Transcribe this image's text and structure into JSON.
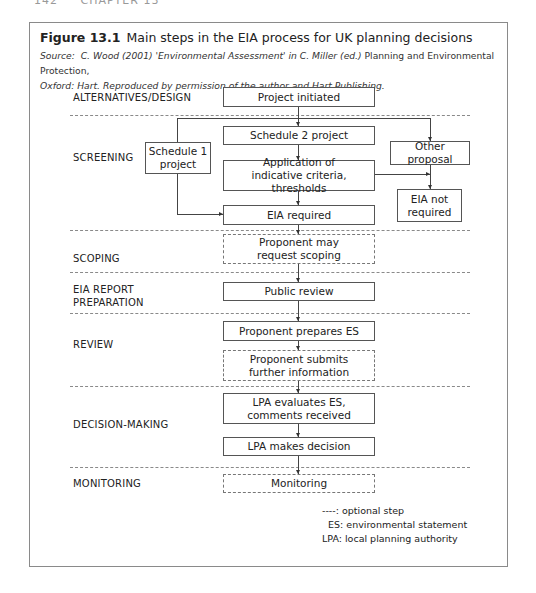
{
  "running_head": {
    "page": "142",
    "chapter": "CHAPTER 13"
  },
  "figure": {
    "label": "Figure 13.1",
    "title": "Main steps in the EIA process for UK planning decisions",
    "source_prefix": "Source:",
    "source_italic_1": "C. Wood (2001) 'Environmental Assessment' in C. Miller (ed.)",
    "source_plain_1": "Planning and Environmental Protection,",
    "source_italic_2": "Oxford: Hart. Reproduced by permission of the author and Hart Publishing."
  },
  "stages": [
    {
      "id": "alternatives",
      "label": "ALTERNATIVES/DESIGN"
    },
    {
      "id": "screening",
      "label": "SCREENING"
    },
    {
      "id": "scoping",
      "label": "SCOPING"
    },
    {
      "id": "eia_report_1",
      "label": "EIA REPORT"
    },
    {
      "id": "eia_report_2",
      "label": "PREPARATION"
    },
    {
      "id": "review",
      "label": "REVIEW"
    },
    {
      "id": "decision",
      "label": "DECISION-MAKING"
    },
    {
      "id": "monitoring",
      "label": "MONITORING"
    }
  ],
  "nodes": {
    "project_initiated": {
      "label": "Project initiated",
      "optional": false
    },
    "schedule2": {
      "label": "Schedule 2 project",
      "optional": false
    },
    "schedule1_l1": {
      "label": "Schedule 1"
    },
    "schedule1_l2": {
      "label": "project"
    },
    "application_l1": {
      "label": "Application of"
    },
    "application_l2": {
      "label": "indicative criteria, thresholds"
    },
    "other_proposal": {
      "label": "Other proposal",
      "optional": false
    },
    "eia_not_required_l1": {
      "label": "EIA not"
    },
    "eia_not_required_l2": {
      "label": "required"
    },
    "eia_required": {
      "label": "EIA required",
      "optional": false
    },
    "scoping_l1": {
      "label": "Proponent may"
    },
    "scoping_l2": {
      "label": "request scoping",
      "optional": true
    },
    "public_review": {
      "label": "Public review",
      "optional": false
    },
    "prepares_es": {
      "label": "Proponent prepares ES",
      "optional": false
    },
    "submits_l1": {
      "label": "Proponent submits"
    },
    "submits_l2": {
      "label": "further information",
      "optional": true
    },
    "lpa_eval_l1": {
      "label": "LPA evaluates ES,"
    },
    "lpa_eval_l2": {
      "label": "comments received"
    },
    "lpa_decision": {
      "label": "LPA makes decision",
      "optional": false
    },
    "monitoring": {
      "label": "Monitoring",
      "optional": true
    }
  },
  "edges": [
    [
      "Project initiated",
      "Schedule 2 project"
    ],
    [
      "Project initiated",
      "Schedule 1 project"
    ],
    [
      "Project initiated",
      "Other proposal"
    ],
    [
      "Schedule 2 project",
      "Application of indicative criteria, thresholds"
    ],
    [
      "Application of indicative criteria, thresholds",
      "EIA required"
    ],
    [
      "Application of indicative criteria, thresholds",
      "EIA not required"
    ],
    [
      "Other proposal",
      "EIA not required"
    ],
    [
      "Schedule 1 project",
      "EIA required"
    ],
    [
      "EIA required",
      "Proponent may request scoping"
    ],
    [
      "Proponent may request scoping",
      "Public review"
    ],
    [
      "Public review",
      "Proponent prepares ES"
    ],
    [
      "Proponent prepares ES",
      "Proponent submits further information"
    ],
    [
      "Proponent submits further information",
      "LPA evaluates ES, comments received"
    ],
    [
      "LPA evaluates ES, comments received",
      "LPA makes decision"
    ],
    [
      "LPA makes decision",
      "Monitoring"
    ]
  ],
  "legend": {
    "optional": "----: optional step",
    "es": "  ES: environmental statement",
    "lpa": "LPA: local planning authority"
  }
}
